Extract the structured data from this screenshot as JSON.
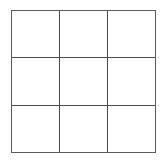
{
  "game": {
    "type": "tic-tac-toe",
    "rows": 3,
    "cols": 3,
    "line_color": "#4a4a4a",
    "background": "#ffffff",
    "cells": [
      [
        "",
        "",
        ""
      ],
      [
        "",
        "",
        ""
      ],
      [
        "",
        "",
        ""
      ]
    ]
  }
}
